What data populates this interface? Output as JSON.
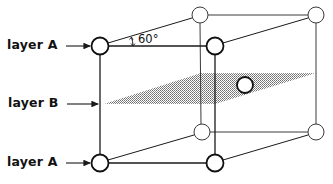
{
  "labels": {
    "layer_top": "layer A",
    "layer_middle": "layer B",
    "layer_bottom": "layer A",
    "angle": "60°"
  },
  "colors": {
    "stroke": "#1a1a1a",
    "background": "#ffffff",
    "plane_fill": "#9a9a9a"
  },
  "atoms": {
    "front_top_left": {
      "cx": 100,
      "cy": 46,
      "r": 8.5,
      "bold": true
    },
    "front_top_right": {
      "cx": 215,
      "cy": 46,
      "r": 8.5,
      "bold": true
    },
    "back_top_left": {
      "cx": 200,
      "cy": 15,
      "r": 8,
      "bold": false
    },
    "back_top_right": {
      "cx": 316,
      "cy": 15,
      "r": 8,
      "bold": false
    },
    "front_bottom_left": {
      "cx": 100,
      "cy": 163,
      "r": 8.5,
      "bold": true
    },
    "front_bottom_right": {
      "cx": 215,
      "cy": 163,
      "r": 8.5,
      "bold": true
    },
    "back_bottom_left": {
      "cx": 202,
      "cy": 132,
      "r": 8,
      "bold": false
    },
    "back_bottom_right": {
      "cx": 316,
      "cy": 132,
      "r": 8,
      "bold": false
    },
    "center_layer_b": {
      "cx": 245,
      "cy": 85,
      "r": 8,
      "bold": true
    }
  },
  "plane_b": {
    "points": "104,104 201,73 316,73 215,104"
  }
}
